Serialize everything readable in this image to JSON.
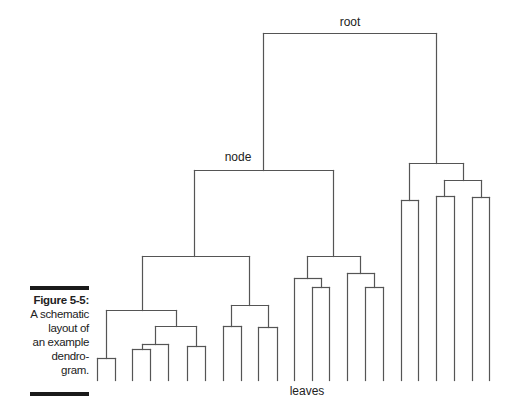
{
  "labels": {
    "root": "root",
    "node": "node",
    "leaves": "leaves"
  },
  "caption": {
    "figure": "Figure 5-5:",
    "lines": [
      "A schematic",
      "layout of",
      "an example",
      "dendro-",
      "gram."
    ]
  },
  "style": {
    "line_color": "#555555",
    "text_color": "#222222",
    "bar_color": "#1a1a1a"
  },
  "dendrogram": {
    "baseline_y": 380,
    "segments": [
      [
        263,
        33,
        436,
        33
      ],
      [
        263,
        33,
        263,
        170
      ],
      [
        436,
        33,
        436,
        163
      ],
      [
        194,
        170,
        333,
        170
      ],
      [
        194,
        170,
        194,
        256
      ],
      [
        333,
        170,
        333,
        256
      ],
      [
        142,
        256,
        249,
        256
      ],
      [
        142,
        256,
        142,
        310
      ],
      [
        249,
        256,
        249,
        305
      ],
      [
        106,
        310,
        176,
        310
      ],
      [
        106,
        310,
        106,
        358
      ],
      [
        176,
        310,
        176,
        326
      ],
      [
        97,
        358,
        115,
        358
      ],
      [
        97,
        358,
        97,
        380
      ],
      [
        115,
        358,
        115,
        380
      ],
      [
        155,
        326,
        196,
        326
      ],
      [
        155,
        326,
        155,
        344
      ],
      [
        196,
        326,
        196,
        346
      ],
      [
        142,
        344,
        168,
        344
      ],
      [
        142,
        344,
        142,
        349
      ],
      [
        168,
        344,
        168,
        380
      ],
      [
        132,
        349,
        150,
        349
      ],
      [
        132,
        349,
        132,
        380
      ],
      [
        150,
        349,
        150,
        380
      ],
      [
        187,
        346,
        205,
        346
      ],
      [
        187,
        346,
        187,
        380
      ],
      [
        205,
        346,
        205,
        380
      ],
      [
        231,
        305,
        268,
        305
      ],
      [
        231,
        305,
        231,
        326
      ],
      [
        268,
        305,
        268,
        327
      ],
      [
        223,
        326,
        241,
        326
      ],
      [
        223,
        326,
        223,
        380
      ],
      [
        241,
        326,
        241,
        380
      ],
      [
        258,
        327,
        277,
        327
      ],
      [
        258,
        327,
        258,
        380
      ],
      [
        277,
        327,
        277,
        380
      ],
      [
        307,
        256,
        360,
        256
      ],
      [
        307,
        256,
        307,
        278
      ],
      [
        360,
        256,
        360,
        273
      ],
      [
        294,
        278,
        321,
        278
      ],
      [
        294,
        278,
        294,
        380
      ],
      [
        321,
        278,
        321,
        287
      ],
      [
        312,
        287,
        329,
        287
      ],
      [
        312,
        287,
        312,
        380
      ],
      [
        329,
        287,
        329,
        380
      ],
      [
        347,
        273,
        374,
        273
      ],
      [
        347,
        273,
        347,
        380
      ],
      [
        374,
        273,
        374,
        287
      ],
      [
        365,
        287,
        383,
        287
      ],
      [
        365,
        287,
        365,
        380
      ],
      [
        383,
        287,
        383,
        380
      ],
      [
        409,
        163,
        463,
        163
      ],
      [
        409,
        163,
        409,
        200
      ],
      [
        463,
        163,
        463,
        180
      ],
      [
        401,
        200,
        418,
        200
      ],
      [
        401,
        200,
        401,
        380
      ],
      [
        418,
        200,
        418,
        380
      ],
      [
        444,
        180,
        481,
        180
      ],
      [
        444,
        180,
        444,
        196
      ],
      [
        481,
        180,
        481,
        197
      ],
      [
        436,
        196,
        454,
        196
      ],
      [
        436,
        196,
        436,
        380
      ],
      [
        454,
        196,
        454,
        380
      ],
      [
        472,
        197,
        489,
        197
      ],
      [
        472,
        197,
        472,
        380
      ],
      [
        489,
        197,
        489,
        380
      ]
    ]
  }
}
